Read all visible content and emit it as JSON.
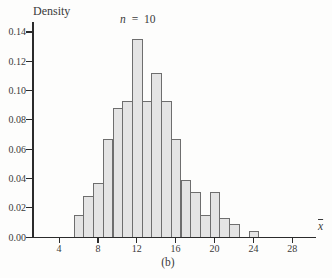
{
  "figure": {
    "ylabel": "Density",
    "xlabel": "x",
    "caption": "(b)",
    "annotation": {
      "variable": "n",
      "rest": " = 10"
    }
  },
  "chart_data": {
    "type": "bar",
    "subtype": "histogram",
    "title": "n = 10",
    "ylabel": "Density",
    "xlabel": "x-bar (sample mean)",
    "caption": "(b)",
    "bin_width": 1,
    "xlim": [
      1.3,
      30.5
    ],
    "ylim": [
      0,
      0.147
    ],
    "grid": false,
    "x_ticks": [
      4,
      8,
      12,
      16,
      20,
      24,
      28
    ],
    "y_ticks": [
      0.0,
      0.02,
      0.04,
      0.06,
      0.08,
      0.1,
      0.12,
      0.14
    ],
    "y_tick_labels": [
      "0.00",
      "0.02",
      "0.04",
      "0.06",
      "0.08",
      "0.10",
      "0.12",
      "0.14"
    ],
    "bins": [
      {
        "center": 6,
        "density": 0.015
      },
      {
        "center": 7,
        "density": 0.028
      },
      {
        "center": 8,
        "density": 0.037
      },
      {
        "center": 9,
        "density": 0.067
      },
      {
        "center": 10,
        "density": 0.088
      },
      {
        "center": 11,
        "density": 0.093
      },
      {
        "center": 12,
        "density": 0.135
      },
      {
        "center": 13,
        "density": 0.093
      },
      {
        "center": 14,
        "density": 0.112
      },
      {
        "center": 15,
        "density": 0.093
      },
      {
        "center": 16,
        "density": 0.067
      },
      {
        "center": 17,
        "density": 0.039
      },
      {
        "center": 18,
        "density": 0.031
      },
      {
        "center": 19,
        "density": 0.015
      },
      {
        "center": 20,
        "density": 0.031
      },
      {
        "center": 21,
        "density": 0.013
      },
      {
        "center": 22,
        "density": 0.009
      },
      {
        "center": 23,
        "density": 0.0
      },
      {
        "center": 24,
        "density": 0.004
      }
    ]
  },
  "colors": {
    "bar_fill": "#e4e4e4",
    "bar_border": "#6e6e6e",
    "axis": "#2b2b2b",
    "text": "#3a3a3a"
  }
}
